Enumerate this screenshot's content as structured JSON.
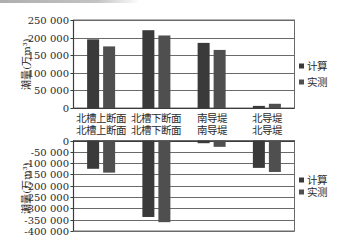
{
  "chart_data": [
    {
      "type": "bar",
      "title": "",
      "xlabel": "",
      "ylabel": "潮量(万m³)",
      "categories": [
        "北槽上断面",
        "北槽下断面",
        "南导堤",
        "北导堤"
      ],
      "series": [
        {
          "name": "计算",
          "color": "#3a3a3a",
          "values": [
            195000,
            221000,
            185000,
            6000
          ]
        },
        {
          "name": "实测",
          "color": "#4f4f4f",
          "values": [
            175000,
            206000,
            165000,
            12000
          ]
        }
      ],
      "ylim": [
        0,
        250000
      ],
      "yticks": [
        0,
        50000,
        100000,
        150000,
        200000,
        250000
      ],
      "ytick_labels": [
        "0",
        "50 000",
        "100 000",
        "150 000",
        "200 000",
        "250 000"
      ],
      "grid": true,
      "legend_position": "right"
    },
    {
      "type": "bar",
      "title": "",
      "xlabel": "",
      "ylabel": "潮量(万m³)",
      "categories": [
        "北槽上断面",
        "北槽下断面",
        "南导堤",
        "北导堤"
      ],
      "series": [
        {
          "name": "计算",
          "color": "#3a3a3a",
          "values": [
            -125000,
            -338000,
            -12000,
            -121000
          ]
        },
        {
          "name": "实测",
          "color": "#4f4f4f",
          "values": [
            -142000,
            -361000,
            -28000,
            -139000
          ]
        }
      ],
      "ylim": [
        -400000,
        0
      ],
      "yticks": [
        0,
        -50000,
        -100000,
        -150000,
        -200000,
        -250000,
        -300000,
        -350000,
        -400000
      ],
      "ytick_labels": [
        "0",
        "-50 000",
        "-100 000",
        "-150 000",
        "-200 000",
        "-250 000",
        "-300 000",
        "-350 000",
        "-400 000"
      ],
      "grid": true,
      "legend_position": "right"
    }
  ],
  "colors": {
    "grid": "#6a6a6a",
    "axis": "#3c3c3c",
    "background": "#ffffff"
  }
}
